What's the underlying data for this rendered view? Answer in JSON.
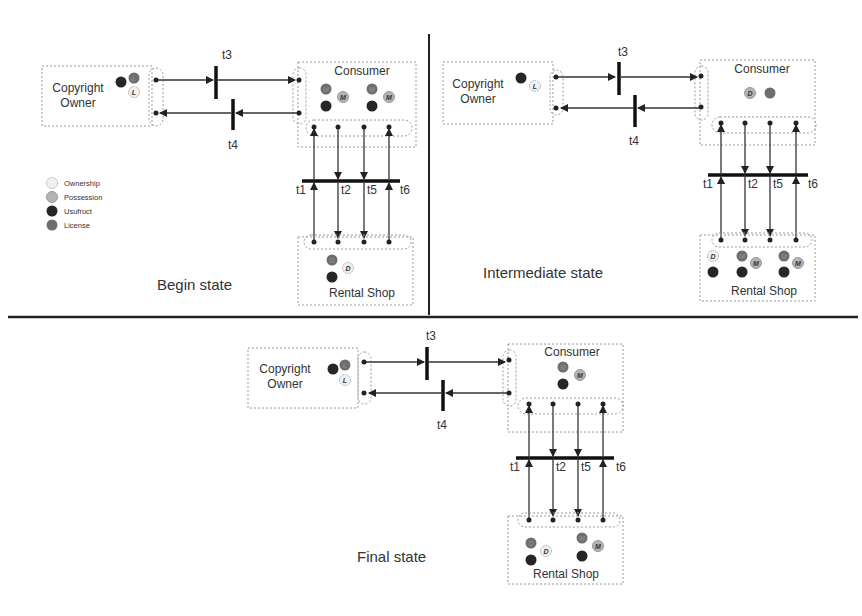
{
  "legend": {
    "items": [
      {
        "label": "Ownership",
        "token": "ownership"
      },
      {
        "label": "Possession",
        "token": "possession"
      },
      {
        "label": "Usufruct",
        "token": "usufruct"
      },
      {
        "label": "License",
        "token": "license"
      }
    ]
  },
  "places": {
    "copyright_owner": {
      "line1": "Copyright",
      "line2": "Owner"
    },
    "consumer": "Consumer",
    "rental_shop": "Rental Shop"
  },
  "transitions": {
    "t1": "t1",
    "t2": "t2",
    "t3": "t3",
    "t4": "t4",
    "t5": "t5",
    "t6": "t6"
  },
  "states": {
    "begin": "Begin state",
    "intermediate": "Intermediate state",
    "final": "Final state"
  },
  "colors": {
    "ownership": "#f0f0f0",
    "possession": "#b4b4b4",
    "usufruct": "#262626",
    "license": "#6e6e6e",
    "divider": "#222222"
  }
}
